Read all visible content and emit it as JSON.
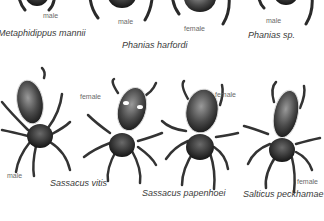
{
  "top_row": [
    {
      "species": "Metaphidippus mannii",
      "sex": "male"
    },
    {
      "species": "Phanias harfordi",
      "sex": "male"
    },
    {
      "species": "Phanias harfordi",
      "sex": "female"
    },
    {
      "species": "Phanias sp.",
      "sex": "male"
    }
  ],
  "bottom_row": [
    {
      "species": "Sassacus vitis",
      "sex_left": "male",
      "sex_right": "female"
    },
    {
      "species": "Sassacus papenhoei",
      "sex": "female"
    },
    {
      "species": "Salticus peckhamae",
      "sex": "female"
    }
  ]
}
